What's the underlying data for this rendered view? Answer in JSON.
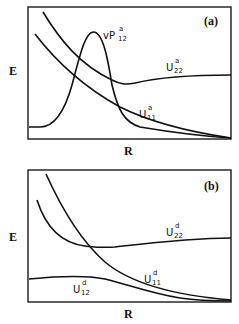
{
  "panels": [
    {
      "id": "a",
      "panel_label": "(a)",
      "y_axis_label": "E",
      "x_axis_label": "R",
      "curves": [
        {
          "name": "vP12a",
          "prefix": "vP",
          "sub": "12",
          "sup": "a"
        },
        {
          "name": "U22a",
          "prefix": "U",
          "sub": "22",
          "sup": "a"
        },
        {
          "name": "U11a",
          "prefix": "U",
          "sub": "11",
          "sup": "a"
        }
      ]
    },
    {
      "id": "b",
      "panel_label": "(b)",
      "y_axis_label": "E",
      "x_axis_label": "R",
      "curves": [
        {
          "name": "U22d",
          "prefix": "U",
          "sub": "22",
          "sup": "d"
        },
        {
          "name": "U11d",
          "prefix": "U",
          "sub": "11",
          "sup": "d"
        },
        {
          "name": "U12d",
          "prefix": "U",
          "sub": "12",
          "sup": "d"
        }
      ]
    }
  ]
}
